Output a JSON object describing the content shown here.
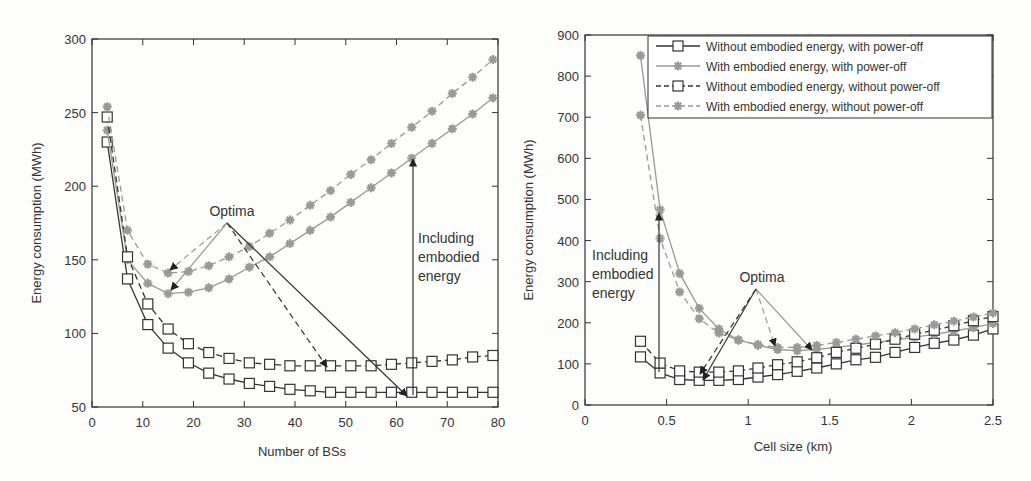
{
  "chart_data": [
    {
      "type": "line",
      "title": "",
      "xlabel": "Number of BSs",
      "ylabel": "Energy consumption (MWh)",
      "xlim": [
        0,
        80
      ],
      "ylim": [
        50,
        300
      ],
      "xticks": [
        0,
        10,
        20,
        30,
        40,
        50,
        60,
        70,
        80
      ],
      "yticks": [
        50,
        100,
        150,
        200,
        250,
        300
      ],
      "grid": false,
      "x": [
        3,
        7,
        11,
        15,
        19,
        23,
        27,
        31,
        35,
        39,
        43,
        47,
        51,
        55,
        59,
        63,
        67,
        71,
        75,
        79
      ],
      "series": [
        {
          "name": "Without embodied energy, with power-off",
          "marker": "square",
          "dash": "solid",
          "color": "#333333",
          "values": [
            230,
            137,
            106,
            90,
            80,
            73,
            69,
            66,
            64,
            62,
            61,
            60,
            60,
            60,
            60,
            60,
            60,
            60,
            60,
            60
          ]
        },
        {
          "name": "With embodied energy, with power-off",
          "marker": "star",
          "dash": "solid",
          "color": "#999999",
          "values": [
            238,
            150,
            134,
            127,
            128,
            131,
            137,
            145,
            152,
            161,
            170,
            179,
            189,
            199,
            209,
            219,
            229,
            239,
            249,
            260
          ]
        },
        {
          "name": "Without embodied energy, without power-off",
          "marker": "square",
          "dash": "dashed",
          "color": "#333333",
          "values": [
            247,
            152,
            120,
            103,
            93,
            87,
            83,
            80,
            79,
            78,
            78,
            78,
            78,
            78,
            79,
            80,
            81,
            82,
            84,
            85
          ]
        },
        {
          "name": "With embodied energy, without power-off",
          "marker": "star",
          "dash": "dashed",
          "color": "#999999",
          "values": [
            254,
            170,
            147,
            141,
            142,
            146,
            152,
            159,
            168,
            177,
            187,
            197,
            208,
            218,
            229,
            240,
            251,
            263,
            274,
            286
          ]
        }
      ],
      "annotations": [
        {
          "text": "Optima",
          "x": 27,
          "y": 180
        },
        {
          "text": "Including embodied energy",
          "x": 64,
          "y": 160
        }
      ]
    },
    {
      "type": "line",
      "title": "",
      "xlabel": "Cell size (km)",
      "ylabel": "Energy consumption (MWh)",
      "xlim": [
        0,
        2.5
      ],
      "ylim": [
        0,
        900
      ],
      "xticks": [
        0,
        0.5,
        1,
        1.5,
        2,
        2.5
      ],
      "yticks": [
        0,
        100,
        200,
        300,
        400,
        500,
        600,
        700,
        800,
        900
      ],
      "grid": false,
      "legend_position": "upper right",
      "x": [
        0.34,
        0.46,
        0.58,
        0.7,
        0.82,
        0.94,
        1.06,
        1.18,
        1.3,
        1.42,
        1.54,
        1.66,
        1.78,
        1.9,
        2.02,
        2.14,
        2.26,
        2.38,
        2.5
      ],
      "series": [
        {
          "name": "Without embodied energy, with power-off",
          "marker": "square",
          "dash": "solid",
          "color": "#333333",
          "values": [
            117,
            78,
            62,
            60,
            60,
            62,
            68,
            74,
            82,
            90,
            100,
            110,
            116,
            128,
            140,
            150,
            158,
            170,
            185
          ]
        },
        {
          "name": "With embodied energy, with power-off",
          "marker": "star",
          "dash": "solid",
          "color": "#999999",
          "values": [
            850,
            475,
            320,
            235,
            185,
            158,
            145,
            135,
            132,
            135,
            140,
            146,
            152,
            158,
            165,
            172,
            180,
            188,
            198
          ]
        },
        {
          "name": "Without embodied energy, without power-off",
          "marker": "square",
          "dash": "dashed",
          "color": "#333333",
          "values": [
            155,
            102,
            83,
            80,
            80,
            83,
            90,
            98,
            105,
            115,
            128,
            138,
            148,
            160,
            172,
            182,
            193,
            205,
            215
          ]
        },
        {
          "name": "With embodied energy, without power-off",
          "marker": "star",
          "dash": "dashed",
          "color": "#999999",
          "values": [
            705,
            405,
            275,
            210,
            175,
            158,
            147,
            140,
            140,
            145,
            152,
            160,
            168,
            176,
            185,
            195,
            204,
            214,
            224
          ]
        }
      ],
      "annotations": [
        {
          "text": "Optima",
          "x": 1.06,
          "y": 290
        },
        {
          "text": "Including embodied energy",
          "x": 0.1,
          "y": 320
        }
      ]
    }
  ],
  "labels": {
    "left": {
      "xlabel": "Number of BSs",
      "ylabel": "Energy consumption (MWh)",
      "xticks": [
        "0",
        "10",
        "20",
        "30",
        "40",
        "50",
        "60",
        "70",
        "80"
      ],
      "yticks": [
        "50",
        "100",
        "150",
        "200",
        "250",
        "300"
      ],
      "optima": "Optima",
      "including": [
        "Including",
        "embodied",
        "energy"
      ]
    },
    "right": {
      "xlabel": "Cell size (km)",
      "ylabel": "Energy consumption (MWh)",
      "xticks": [
        "0",
        "0.5",
        "1",
        "1.5",
        "2",
        "2.5"
      ],
      "yticks": [
        "0",
        "100",
        "200",
        "300",
        "400",
        "500",
        "600",
        "700",
        "800",
        "900"
      ],
      "optima": "Optima",
      "including": [
        "Including",
        "embodied",
        "energy"
      ]
    },
    "legend": [
      "Without embodied energy, with power-off",
      "With embodied energy, with power-off",
      "Without embodied energy, without power-off",
      "With embodied energy, without power-off"
    ]
  }
}
